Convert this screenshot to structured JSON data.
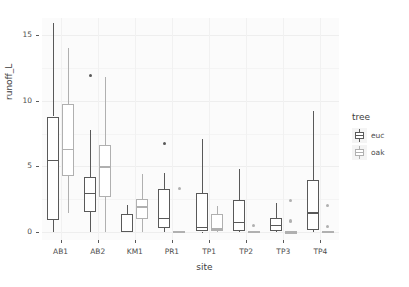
{
  "chart_data": {
    "type": "box",
    "title": "",
    "xlabel": "site",
    "ylabel": "runoff_L",
    "ylim": [
      -0.6,
      16.3
    ],
    "yticks": [
      0,
      5,
      10,
      15
    ],
    "ytick_labels": [
      "0",
      "5",
      "10",
      "15"
    ],
    "categories": [
      "AB1",
      "AB2",
      "KM1",
      "PR1",
      "TP1",
      "TP2",
      "TP3",
      "TP4"
    ],
    "legend": {
      "title": "tree",
      "position": "right",
      "entries": [
        {
          "name": "euc",
          "color": "#595959"
        },
        {
          "name": "oak",
          "color": "#b0b0b0"
        }
      ]
    },
    "grid": true,
    "series": [
      {
        "name": "euc",
        "color": "#595959",
        "boxes": [
          {
            "site": "AB1",
            "min": 0.0,
            "q1": 0.95,
            "median": 5.45,
            "q3": 8.8,
            "max": 15.95,
            "outliers": []
          },
          {
            "site": "AB2",
            "min": 0.0,
            "q1": 1.5,
            "median": 2.95,
            "q3": 4.2,
            "max": 7.75,
            "outliers": [
              11.95
            ]
          },
          {
            "site": "KM1",
            "min": 0.0,
            "q1": 0.0,
            "median": 0.05,
            "q3": 1.35,
            "max": 2.1,
            "outliers": []
          },
          {
            "site": "PR1",
            "min": 0.0,
            "q1": 0.3,
            "median": 1.05,
            "q3": 3.3,
            "max": 4.5,
            "outliers": [
              6.75
            ]
          },
          {
            "site": "TP1",
            "min": 0.0,
            "q1": 0.05,
            "median": 0.35,
            "q3": 3.0,
            "max": 7.1,
            "outliers": []
          },
          {
            "site": "TP2",
            "min": 0.0,
            "q1": 0.1,
            "median": 0.75,
            "q3": 2.45,
            "max": 4.8,
            "outliers": []
          },
          {
            "site": "TP3",
            "min": 0.0,
            "q1": 0.1,
            "median": 0.5,
            "q3": 1.1,
            "max": 2.2,
            "outliers": []
          },
          {
            "site": "TP4",
            "min": 0.0,
            "q1": 0.15,
            "median": 1.45,
            "q3": 4.0,
            "max": 9.2,
            "outliers": []
          }
        ]
      },
      {
        "name": "oak",
        "color": "#b0b0b0",
        "boxes": [
          {
            "site": "AB1",
            "min": 1.45,
            "q1": 4.3,
            "median": 6.3,
            "q3": 9.75,
            "max": 14.0,
            "outliers": []
          },
          {
            "site": "AB2",
            "min": 0.0,
            "q1": 2.7,
            "median": 4.95,
            "q3": 6.6,
            "max": 11.85,
            "outliers": []
          },
          {
            "site": "KM1",
            "min": 0.0,
            "q1": 1.0,
            "median": 1.9,
            "q3": 2.5,
            "max": 4.4,
            "outliers": []
          },
          {
            "site": "PR1",
            "min": 0.0,
            "q1": 0.0,
            "median": 0.0,
            "q3": 0.0,
            "max": 0.0,
            "outliers": [
              3.3
            ]
          },
          {
            "site": "TP1",
            "min": 0.0,
            "q1": 0.1,
            "median": 0.25,
            "q3": 1.35,
            "max": 2.0,
            "outliers": []
          },
          {
            "site": "TP2",
            "min": 0.0,
            "q1": 0.0,
            "median": 0.0,
            "q3": 0.0,
            "max": 0.0,
            "outliers": [
              0.5
            ]
          },
          {
            "site": "TP3",
            "min": 0.0,
            "q1": 0.0,
            "median": 0.0,
            "q3": 0.05,
            "max": 0.1,
            "outliers": [
              2.4,
              0.85
            ]
          },
          {
            "site": "TP4",
            "min": 0.0,
            "q1": 0.0,
            "median": 0.0,
            "q3": 0.0,
            "max": 0.0,
            "outliers": [
              2.05,
              0.4
            ]
          }
        ]
      }
    ]
  }
}
